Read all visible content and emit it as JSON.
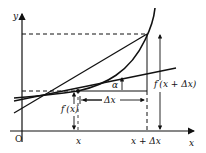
{
  "diagram": {
    "type": "derivative-secant-tangent",
    "labels": {
      "y_axis": "y",
      "x_axis": "x",
      "origin": "O",
      "x_tick": "x",
      "x_plus_dx_tick": "x + Δx",
      "delta_x": "Δx",
      "alpha": "α",
      "f_x": "f′(x)",
      "f_x_plus_dx": "f′(x + Δx)"
    },
    "colors": {
      "stroke": "#111111",
      "background": "#ffffff"
    }
  }
}
